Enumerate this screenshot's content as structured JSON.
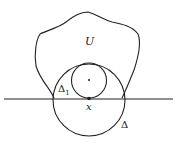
{
  "figure": {
    "labels": {
      "region": "U",
      "small_disk": "Δ",
      "small_disk_sub": "1",
      "point": "x",
      "large_disk": "Δ"
    },
    "colors": {
      "stroke": "#222222",
      "background": "#ffffff"
    }
  }
}
